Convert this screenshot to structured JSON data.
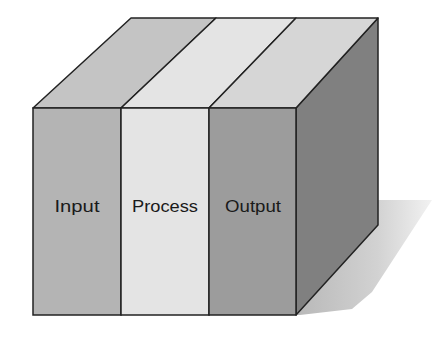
{
  "diagram": {
    "type": "3d-box-segments",
    "segments": [
      {
        "label": "Input",
        "front_color": "#b4b4b4",
        "top_color": "#c4c4c4"
      },
      {
        "label": "Process",
        "front_color": "#e4e4e4",
        "top_color": "#e4e4e4"
      },
      {
        "label": "Output",
        "front_color": "#9c9c9c",
        "top_color": "#d6d6d6"
      }
    ],
    "side_color": "#808080",
    "edge_color": "#222222",
    "shadow_color": "#c8c8c8"
  }
}
